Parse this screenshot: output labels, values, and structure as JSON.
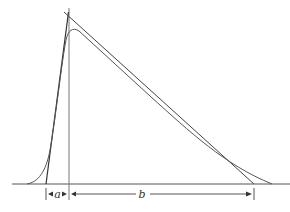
{
  "diagram": {
    "colors": {
      "line": "#444444",
      "curve": "#555555",
      "background": "#ffffff"
    },
    "labels": {
      "rise_width": "a",
      "decay_width": "b"
    },
    "elements": [
      "baseline",
      "vertical-peak-line",
      "triangle-rise-leg",
      "triangle-decay-leg",
      "pulse-curve",
      "dimension-a",
      "dimension-b"
    ]
  }
}
